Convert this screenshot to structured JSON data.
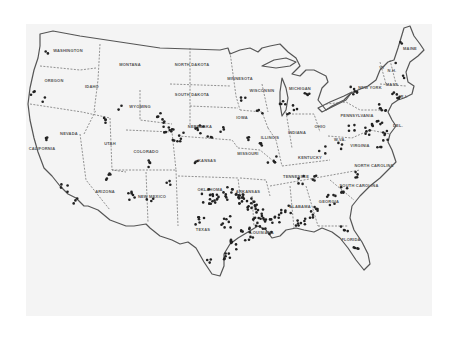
{
  "map": {
    "title": "United States",
    "style": "scanned black-and-white outline map with dot markers",
    "colors": {
      "background": "#f4f4f4",
      "outline": "#555555",
      "dots": "#222222",
      "labels": "#555555"
    },
    "state_labels": [
      {
        "name": "WASHINGTON",
        "x": 68,
        "y": 52
      },
      {
        "name": "OREGON",
        "x": 54,
        "y": 82
      },
      {
        "name": "IDAHO",
        "x": 92,
        "y": 88
      },
      {
        "name": "MONTANA",
        "x": 130,
        "y": 66
      },
      {
        "name": "NORTH DAKOTA",
        "x": 192,
        "y": 66
      },
      {
        "name": "SOUTH DAKOTA",
        "x": 192,
        "y": 96
      },
      {
        "name": "WYOMING",
        "x": 140,
        "y": 108
      },
      {
        "name": "NEBRASKA",
        "x": 200,
        "y": 128
      },
      {
        "name": "MINNESOTA",
        "x": 240,
        "y": 80
      },
      {
        "name": "WISCONSIN",
        "x": 262,
        "y": 92
      },
      {
        "name": "MICHIGAN",
        "x": 300,
        "y": 90
      },
      {
        "name": "IOWA",
        "x": 242,
        "y": 119
      },
      {
        "name": "ILLINOIS",
        "x": 270,
        "y": 139
      },
      {
        "name": "INDIANA",
        "x": 297,
        "y": 134
      },
      {
        "name": "OHIO",
        "x": 320,
        "y": 128
      },
      {
        "name": "PENNSYLVANIA",
        "x": 357,
        "y": 117
      },
      {
        "name": "NEW YORK",
        "x": 370,
        "y": 89
      },
      {
        "name": "MAINE",
        "x": 410,
        "y": 50
      },
      {
        "name": "VT",
        "x": 382,
        "y": 69
      },
      {
        "name": "N.H.",
        "x": 392,
        "y": 72
      },
      {
        "name": "MASS",
        "x": 392,
        "y": 86
      },
      {
        "name": "R.I.",
        "x": 404,
        "y": 98
      },
      {
        "name": "DEL.",
        "x": 398,
        "y": 127
      },
      {
        "name": "W.VA.",
        "x": 340,
        "y": 141
      },
      {
        "name": "VIRGINIA",
        "x": 360,
        "y": 147
      },
      {
        "name": "KENTUCKY",
        "x": 310,
        "y": 159
      },
      {
        "name": "NORTH CAROLINA",
        "x": 374,
        "y": 167
      },
      {
        "name": "TENNESSEE",
        "x": 296,
        "y": 178
      },
      {
        "name": "SOUTH CAROLINA",
        "x": 359,
        "y": 187
      },
      {
        "name": "GEORGIA",
        "x": 329,
        "y": 203
      },
      {
        "name": "ALABAMA",
        "x": 300,
        "y": 208
      },
      {
        "name": "ARKANSAS",
        "x": 248,
        "y": 193
      },
      {
        "name": "MISSOURI",
        "x": 248,
        "y": 155
      },
      {
        "name": "KANSAS",
        "x": 207,
        "y": 162
      },
      {
        "name": "OKLAHOMA",
        "x": 210,
        "y": 191
      },
      {
        "name": "TEXAS",
        "x": 203,
        "y": 231
      },
      {
        "name": "LOUISIANA",
        "x": 262,
        "y": 234
      },
      {
        "name": "FLORIDA",
        "x": 351,
        "y": 241
      },
      {
        "name": "COLORADO",
        "x": 146,
        "y": 153
      },
      {
        "name": "UTAH",
        "x": 110,
        "y": 145
      },
      {
        "name": "NEVADA",
        "x": 69,
        "y": 135
      },
      {
        "name": "CALIFORNIA",
        "x": 42,
        "y": 150
      },
      {
        "name": "ARIZONA",
        "x": 105,
        "y": 193
      },
      {
        "name": "NEW MEXICO",
        "x": 152,
        "y": 198
      }
    ],
    "marker_count_approx": 320,
    "marker_description": "Dense clusters along Gulf Coast (TX, LA, MS), Oklahoma, Arkansas, Colorado/Nebraska, eastern seaboard; sparse in the northern plains and mountain west."
  }
}
